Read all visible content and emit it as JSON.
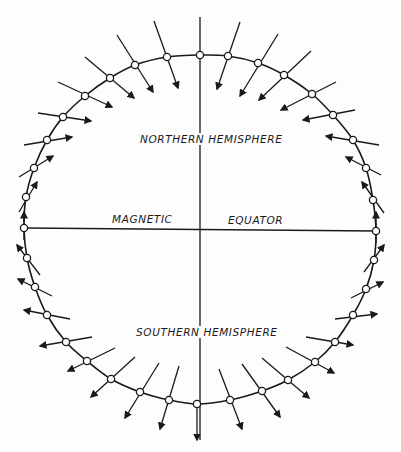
{
  "diagram": {
    "labels": {
      "northern": "NORTHERN HEMISPHERE",
      "southern": "SOUTHERN HEMISPHERE",
      "magnetic": "MAGNETIC",
      "equator": "EQUATOR"
    },
    "colors": {
      "ink": "#1a1a1a",
      "background": "#fdfdfd",
      "marker_fill": "#ffffff"
    },
    "axes": {
      "vertical": {
        "x": 200,
        "y1": 17,
        "y2": 440
      },
      "horizontal": {
        "x1": 24,
        "y1": 228,
        "x2": 376,
        "y2": 231
      }
    },
    "ring_points": [
      [
        200,
        55
      ],
      [
        228,
        56
      ],
      [
        258,
        63
      ],
      [
        284,
        75
      ],
      [
        312,
        94
      ],
      [
        333,
        115
      ],
      [
        353,
        140
      ],
      [
        366,
        168
      ],
      [
        373,
        200
      ],
      [
        376,
        231
      ],
      [
        374,
        260
      ],
      [
        366,
        289
      ],
      [
        353,
        315
      ],
      [
        335,
        342
      ],
      [
        315,
        362
      ],
      [
        288,
        380
      ],
      [
        262,
        391
      ],
      [
        230,
        400
      ],
      [
        197,
        404
      ],
      [
        169,
        400
      ],
      [
        140,
        392
      ],
      [
        111,
        379
      ],
      [
        87,
        361
      ],
      [
        66,
        342
      ],
      [
        47,
        315
      ],
      [
        35,
        287
      ],
      [
        27,
        258
      ],
      [
        24,
        228
      ],
      [
        26,
        197
      ],
      [
        34,
        168
      ],
      [
        47,
        140
      ],
      [
        63,
        117
      ],
      [
        85,
        96
      ],
      [
        110,
        78
      ],
      [
        135,
        65
      ],
      [
        167,
        57
      ]
    ],
    "field_vectors": [
      {
        "p": [
          167,
          57
        ],
        "from": [
          154,
          21
        ],
        "to": [
          178,
          88
        ]
      },
      {
        "p": [
          135,
          65
        ],
        "from": [
          117,
          35
        ],
        "to": [
          153,
          92
        ]
      },
      {
        "p": [
          110,
          78
        ],
        "from": [
          85,
          57
        ],
        "to": [
          134,
          98
        ]
      },
      {
        "p": [
          85,
          96
        ],
        "from": [
          58,
          82
        ],
        "to": [
          112,
          107
        ]
      },
      {
        "p": [
          63,
          117
        ],
        "from": [
          38,
          113
        ],
        "to": [
          91,
          121
        ]
      },
      {
        "p": [
          47,
          140
        ],
        "from": [
          24,
          145
        ],
        "to": [
          72,
          137
        ]
      },
      {
        "p": [
          34,
          168
        ],
        "from": [
          19,
          177
        ],
        "to": [
          53,
          156
        ]
      },
      {
        "p": [
          26,
          197
        ],
        "from": [
          19,
          212
        ],
        "to": [
          37,
          182
        ]
      },
      {
        "p": [
          24,
          228
        ],
        "from": [
          24,
          240
        ],
        "to": [
          24,
          212
        ]
      },
      {
        "p": [
          228,
          56
        ],
        "from": [
          240,
          22
        ],
        "to": [
          217,
          89
        ]
      },
      {
        "p": [
          258,
          63
        ],
        "from": [
          278,
          34
        ],
        "to": [
          240,
          96
        ]
      },
      {
        "p": [
          284,
          75
        ],
        "from": [
          311,
          51
        ],
        "to": [
          259,
          100
        ]
      },
      {
        "p": [
          312,
          94
        ],
        "from": [
          336,
          82
        ],
        "to": [
          281,
          110
        ]
      },
      {
        "p": [
          333,
          115
        ],
        "from": [
          355,
          110
        ],
        "to": [
          303,
          120
        ]
      },
      {
        "p": [
          353,
          140
        ],
        "from": [
          379,
          145
        ],
        "to": [
          326,
          136
        ]
      },
      {
        "p": [
          366,
          168
        ],
        "from": [
          381,
          175
        ],
        "to": [
          346,
          157
        ]
      },
      {
        "p": [
          373,
          200
        ],
        "from": [
          384,
          213
        ],
        "to": [
          362,
          182
        ]
      },
      {
        "p": [
          376,
          231
        ],
        "from": [
          376,
          243
        ],
        "to": [
          376,
          212
        ]
      },
      {
        "p": [
          27,
          258
        ],
        "from": [
          40,
          275
        ],
        "to": [
          17,
          245
        ]
      },
      {
        "p": [
          35,
          287
        ],
        "from": [
          52,
          296
        ],
        "to": [
          18,
          279
        ]
      },
      {
        "p": [
          47,
          315
        ],
        "from": [
          70,
          319
        ],
        "to": [
          24,
          310
        ]
      },
      {
        "p": [
          66,
          342
        ],
        "from": [
          92,
          337
        ],
        "to": [
          40,
          346
        ]
      },
      {
        "p": [
          87,
          361
        ],
        "from": [
          115,
          348
        ],
        "to": [
          68,
          371
        ]
      },
      {
        "p": [
          111,
          379
        ],
        "from": [
          135,
          357
        ],
        "to": [
          91,
          397
        ]
      },
      {
        "p": [
          140,
          392
        ],
        "from": [
          159,
          363
        ],
        "to": [
          125,
          418
        ]
      },
      {
        "p": [
          169,
          400
        ],
        "from": [
          179,
          366
        ],
        "to": [
          160,
          429
        ]
      },
      {
        "p": [
          197,
          404
        ],
        "from": [
          197,
          404
        ],
        "to": [
          197,
          440
        ]
      },
      {
        "p": [
          374,
          260
        ],
        "from": [
          364,
          272
        ],
        "to": [
          384,
          245
        ]
      },
      {
        "p": [
          366,
          289
        ],
        "from": [
          351,
          298
        ],
        "to": [
          383,
          282
        ]
      },
      {
        "p": [
          353,
          315
        ],
        "from": [
          335,
          319
        ],
        "to": [
          377,
          314
        ]
      },
      {
        "p": [
          335,
          342
        ],
        "from": [
          306,
          337
        ],
        "to": [
          353,
          345
        ]
      },
      {
        "p": [
          315,
          362
        ],
        "from": [
          286,
          347
        ],
        "to": [
          334,
          373
        ]
      },
      {
        "p": [
          288,
          380
        ],
        "from": [
          262,
          358
        ],
        "to": [
          309,
          398
        ]
      },
      {
        "p": [
          262,
          391
        ],
        "from": [
          242,
          364
        ],
        "to": [
          280,
          417
        ]
      },
      {
        "p": [
          230,
          400
        ],
        "from": [
          219,
          369
        ],
        "to": [
          242,
          429
        ]
      }
    ]
  }
}
